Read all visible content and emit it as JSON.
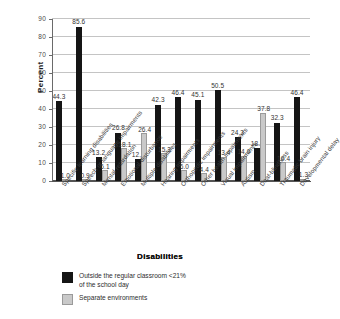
{
  "chart_data": {
    "type": "bar",
    "title": "",
    "xlabel": "Disabilities",
    "ylabel": "Percent",
    "ylim": [
      0,
      90
    ],
    "yticks": [
      0,
      10,
      20,
      30,
      40,
      50,
      60,
      70,
      80,
      90
    ],
    "grid": true,
    "legend_position": "bottom-left",
    "legend_title": "Disabilities",
    "categories": [
      "Specific learning disabilities",
      "Speech or language impairments",
      "Mental retardation",
      "Emotional disturbance",
      "Multiple disabilities",
      "Hearing impairments",
      "Orthopedic impairments",
      "Other health impairments",
      "Visual impairments",
      "Autism",
      "Deaf-blindness",
      "Traumatic brain injury",
      "Developmental delay"
    ],
    "series": [
      {
        "name": "Outside the regular classroom <21% of the school day",
        "color": "#151515",
        "values": [
          44.3,
          85.6,
          13.2,
          26.8,
          12.1,
          42.3,
          46.4,
          45.1,
          50.5,
          24.3,
          18.1,
          32.3,
          46.4
        ],
        "labels": [
          "44.3",
          "85.6",
          "13.2",
          "26.8",
          "12.1",
          "42.3",
          "46.4",
          "45.1",
          "50.5",
          "24.3",
          "18.1",
          "32.3",
          "46.4"
        ]
      },
      {
        "name": "Separate environments",
        "color": "#c9c9c9",
        "values": [
          1.0,
          0.9,
          6.1,
          18.1,
          26.4,
          15.3,
          6.0,
          4.4,
          13.4,
          14.0,
          37.8,
          10.4,
          1.3
        ],
        "labels": [
          "1.0",
          "0.9",
          "6.1",
          "18.1",
          "26.4",
          "15.3",
          "6.0",
          "4.4",
          "13.4",
          "14.0",
          "37.8",
          "10.4",
          "1.3"
        ]
      }
    ]
  },
  "legend": {
    "title": "Disabilities",
    "items": [
      {
        "label": "Outside the regular classroom <21%\nof the school day",
        "line1": "Outside the regular classroom <21%",
        "line2": "of the school day",
        "color": "#151515"
      },
      {
        "label": "Separate environments",
        "line1": "Separate environments",
        "line2": "",
        "color": "#c9c9c9"
      }
    ]
  },
  "axis": {
    "y_title": "Percent",
    "x_title": "Disabilities"
  }
}
